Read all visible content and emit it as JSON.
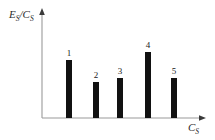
{
  "chart_data": {
    "type": "bar",
    "title": "",
    "subtitle": "",
    "xlabel": "C_S",
    "ylabel": "E_S/C_S",
    "xlabel_parts": {
      "base": "C",
      "sub": "S"
    },
    "ylabel_parts": {
      "num_base": "E",
      "num_sub": "S",
      "slash": "/",
      "den_base": "C",
      "den_sub": "S"
    },
    "categories": [
      "1",
      "2",
      "3",
      "4",
      "5"
    ],
    "values": [
      58,
      36,
      40,
      66,
      40
    ],
    "data_labels": [
      "1",
      "2",
      "3",
      "4",
      "5"
    ],
    "ylim": [
      0,
      108
    ],
    "xlim": [
      0,
      5
    ],
    "grid": false,
    "legend": null,
    "bar_color": "#111111",
    "axis_color": "#9a9a9a",
    "background_color": "#ffffff",
    "axis_ticks_x": [],
    "axis_ticks_y": [],
    "annotations": []
  },
  "geometry": {
    "baseline_y": 118,
    "axis_x": 42,
    "axis_top_y": 10,
    "axis_right_x": 206,
    "bar_width": 6,
    "bar_centers": [
      69,
      96,
      120,
      148,
      174
    ],
    "bar_tops": [
      60,
      82,
      78,
      52,
      78
    ],
    "label_tops": [
      48,
      70,
      66,
      40,
      66
    ]
  }
}
